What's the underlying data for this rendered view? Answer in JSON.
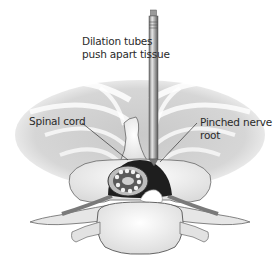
{
  "figure": {
    "labels": {
      "dilation_line1": "Dilation tubes",
      "dilation_line2": "push apart tissue",
      "spinal_cord": "Spinal cord",
      "pinched_line1": "Pinched nerve",
      "pinched_line2": "root"
    },
    "colors": {
      "background": "#ffffff",
      "tissue": "#cfcfcf",
      "bone": "#f4f4f4",
      "outline": "#555555",
      "canal": "#1e1e1e",
      "tube": "#8a8a8a",
      "text": "#2a2a2a"
    }
  }
}
